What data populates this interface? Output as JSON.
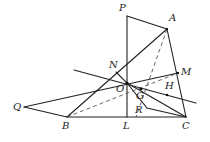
{
  "diagram": {
    "type": "geometry",
    "points": {
      "P": [
        127,
        16
      ],
      "A": [
        167,
        29
      ],
      "N": [
        116,
        72
      ],
      "M": [
        178,
        73
      ],
      "O": [
        127,
        83
      ],
      "G": [
        141,
        89
      ],
      "H": [
        167,
        95
      ],
      "Q": [
        24,
        107
      ],
      "B": [
        67,
        117
      ],
      "L": [
        127,
        117
      ],
      "C": [
        186,
        117
      ],
      "R": [
        147,
        108
      ]
    },
    "labels": [
      {
        "text": "P",
        "x": 119,
        "y": 9
      },
      {
        "text": "A",
        "x": 169,
        "y": 18
      },
      {
        "text": "N",
        "x": 109,
        "y": 65
      },
      {
        "text": "M",
        "x": 181,
        "y": 67
      },
      {
        "text": "O",
        "x": 117,
        "y": 84
      },
      {
        "text": "G",
        "x": 137,
        "y": 91
      },
      {
        "text": "H",
        "x": 165,
        "y": 84
      },
      {
        "text": "Q",
        "x": 14,
        "y": 103
      },
      {
        "text": "B",
        "x": 62,
        "y": 121
      },
      {
        "text": "R",
        "x": 136,
        "y": 106
      },
      {
        "text": "L",
        "x": 123,
        "y": 121
      },
      {
        "text": "C",
        "x": 183,
        "y": 121
      }
    ]
  }
}
